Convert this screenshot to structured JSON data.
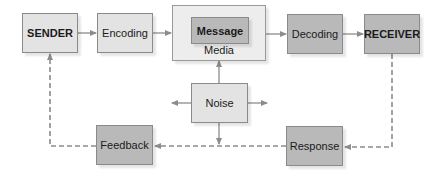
{
  "diagram": {
    "type": "communication-process-model",
    "nodes": {
      "sender": "SENDER",
      "encoding": "Encoding",
      "message": "Message",
      "media": "Media",
      "decoding": "Decoding",
      "receiver": "RECEIVER",
      "noise": "Noise",
      "feedback": "Feedback",
      "response": "Response"
    },
    "edges": [
      {
        "from": "SENDER",
        "to": "Encoding",
        "style": "solid"
      },
      {
        "from": "Encoding",
        "to": "Media",
        "style": "solid"
      },
      {
        "from": "Media",
        "to": "Decoding",
        "style": "solid"
      },
      {
        "from": "Decoding",
        "to": "RECEIVER",
        "style": "solid"
      },
      {
        "from": "Noise",
        "to": "Media",
        "style": "solid"
      },
      {
        "from": "Noise",
        "to": "left",
        "style": "solid"
      },
      {
        "from": "Noise",
        "to": "right",
        "style": "solid"
      },
      {
        "from": "Noise",
        "to": "down",
        "style": "solid"
      },
      {
        "from": "RECEIVER",
        "to": "Response",
        "style": "dashed"
      },
      {
        "from": "Response",
        "to": "Feedback",
        "style": "dashed"
      },
      {
        "from": "Feedback",
        "to": "SENDER",
        "style": "dashed"
      }
    ],
    "colors": {
      "light_box": "#e3e3e3",
      "mid_box": "#b9b9b9",
      "media_box": "#ededed",
      "arrow": "#8c8c8c"
    }
  }
}
